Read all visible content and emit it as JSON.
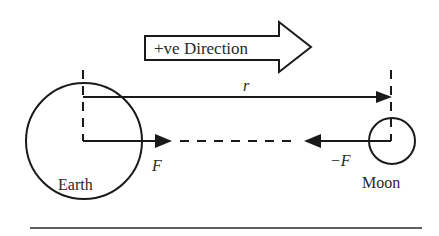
{
  "diagram": {
    "direction_arrow": {
      "label": "+ve Direction"
    },
    "distance": {
      "label": "r"
    },
    "earth": {
      "label": "Earth"
    },
    "moon": {
      "label": "Moon"
    },
    "force_on_earth": {
      "label": "F"
    },
    "force_on_moon": {
      "label": "−F"
    }
  },
  "colors": {
    "stroke": "#1a1a1a",
    "background": "#ffffff"
  }
}
